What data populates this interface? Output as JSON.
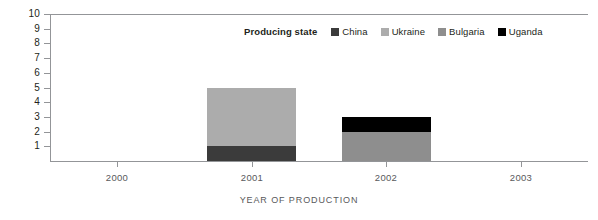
{
  "chart_data": {
    "type": "bar",
    "title": "",
    "subtitle": "",
    "xlabel": "YEAR OF PRODUCTION",
    "ylabel": "",
    "stacked": true,
    "grid": false,
    "legend_position": "top-center",
    "legend_title": "Producing state",
    "categories": [
      "2000",
      "2001",
      "2002",
      "2003"
    ],
    "ylim": [
      0,
      10
    ],
    "yticks": [
      1,
      2,
      3,
      4,
      5,
      6,
      7,
      8,
      9,
      10
    ],
    "ytick_labels": [
      "1",
      "2",
      "3",
      "4",
      "5",
      "6",
      "7",
      "8",
      "9",
      "10"
    ],
    "series": [
      {
        "name": "China",
        "color": "#3b3b3b",
        "values": [
          0,
          1,
          0,
          0
        ]
      },
      {
        "name": "Ukraine",
        "color": "#acacac",
        "values": [
          0,
          4,
          0,
          0
        ]
      },
      {
        "name": "Bulgaria",
        "color": "#8e8e8e",
        "values": [
          0,
          0,
          2,
          0
        ]
      },
      {
        "name": "Uganda",
        "color": "#000000",
        "values": [
          0,
          0,
          1,
          0
        ]
      }
    ],
    "bar_totals": [
      0,
      5,
      3,
      0
    ],
    "axis_color": "#939598",
    "text_color": "#231f20"
  }
}
